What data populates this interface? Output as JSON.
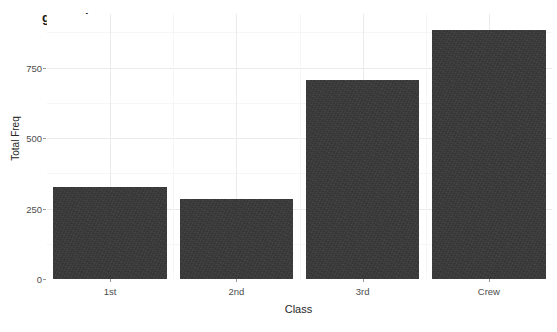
{
  "chart_data": {
    "type": "bar",
    "title": "geom_bar",
    "xlabel": "Class",
    "ylabel": "Total Freq",
    "categories": [
      "1st",
      "2nd",
      "3rd",
      "Crew"
    ],
    "values": [
      325,
      285,
      706,
      885
    ],
    "ylim": [
      0,
      940
    ],
    "y_ticks": [
      0,
      250,
      500,
      750
    ],
    "y_tick_labels": [
      "0",
      "250",
      "500",
      "750"
    ],
    "y_minor_ticks": [
      125,
      375,
      625,
      875
    ],
    "grid": true,
    "legend": "none",
    "bar_color": "#363636",
    "panel_background": "#ffffff",
    "grid_color_major": "#ebebeb",
    "grid_color_minor": "#f6f6f6",
    "text_color": "#4d4d4d",
    "title_color": "#1a1a1a"
  }
}
